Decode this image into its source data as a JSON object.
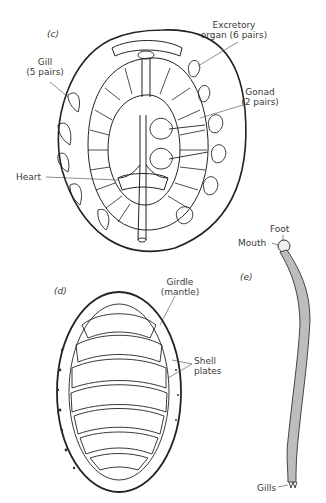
{
  "figure": {
    "panels": [
      {
        "id": "c",
        "label": "(c)",
        "labels": {
          "gill_line1": "Gill",
          "gill_line2": "(5 pairs)",
          "excretory_line1": "Excretory",
          "excretory_line2": "organ (6 pairs)",
          "gonad_line1": "Gonad",
          "gonad_line2": "(2 pairs)",
          "heart": "Heart"
        }
      },
      {
        "id": "d",
        "label": "(d)",
        "labels": {
          "girdle_line1": "Girdle",
          "girdle_line2": "(mantle)",
          "shell_line1": "Shell",
          "shell_line2": "plates"
        }
      },
      {
        "id": "e",
        "label": "(e)",
        "labels": {
          "foot": "Foot",
          "mouth": "Mouth",
          "gills": "Gills"
        }
      }
    ]
  }
}
